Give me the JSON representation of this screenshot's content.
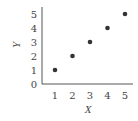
{
  "chart_data": {
    "type": "scatter",
    "title": "",
    "xlabel": "X",
    "ylabel": "Y",
    "x": [
      1,
      2,
      3,
      4,
      5
    ],
    "y": [
      1,
      2,
      3,
      4,
      5
    ],
    "xticks": [
      "1",
      "2",
      "3",
      "4",
      "5"
    ],
    "yticks": [
      "0",
      "1",
      "2",
      "3",
      "4",
      "5"
    ],
    "xlim": [
      0,
      5.3
    ],
    "ylim": [
      0,
      5.3
    ],
    "grid": false,
    "legend": null,
    "marker_color": "#333333",
    "axis_color": "#555555"
  }
}
